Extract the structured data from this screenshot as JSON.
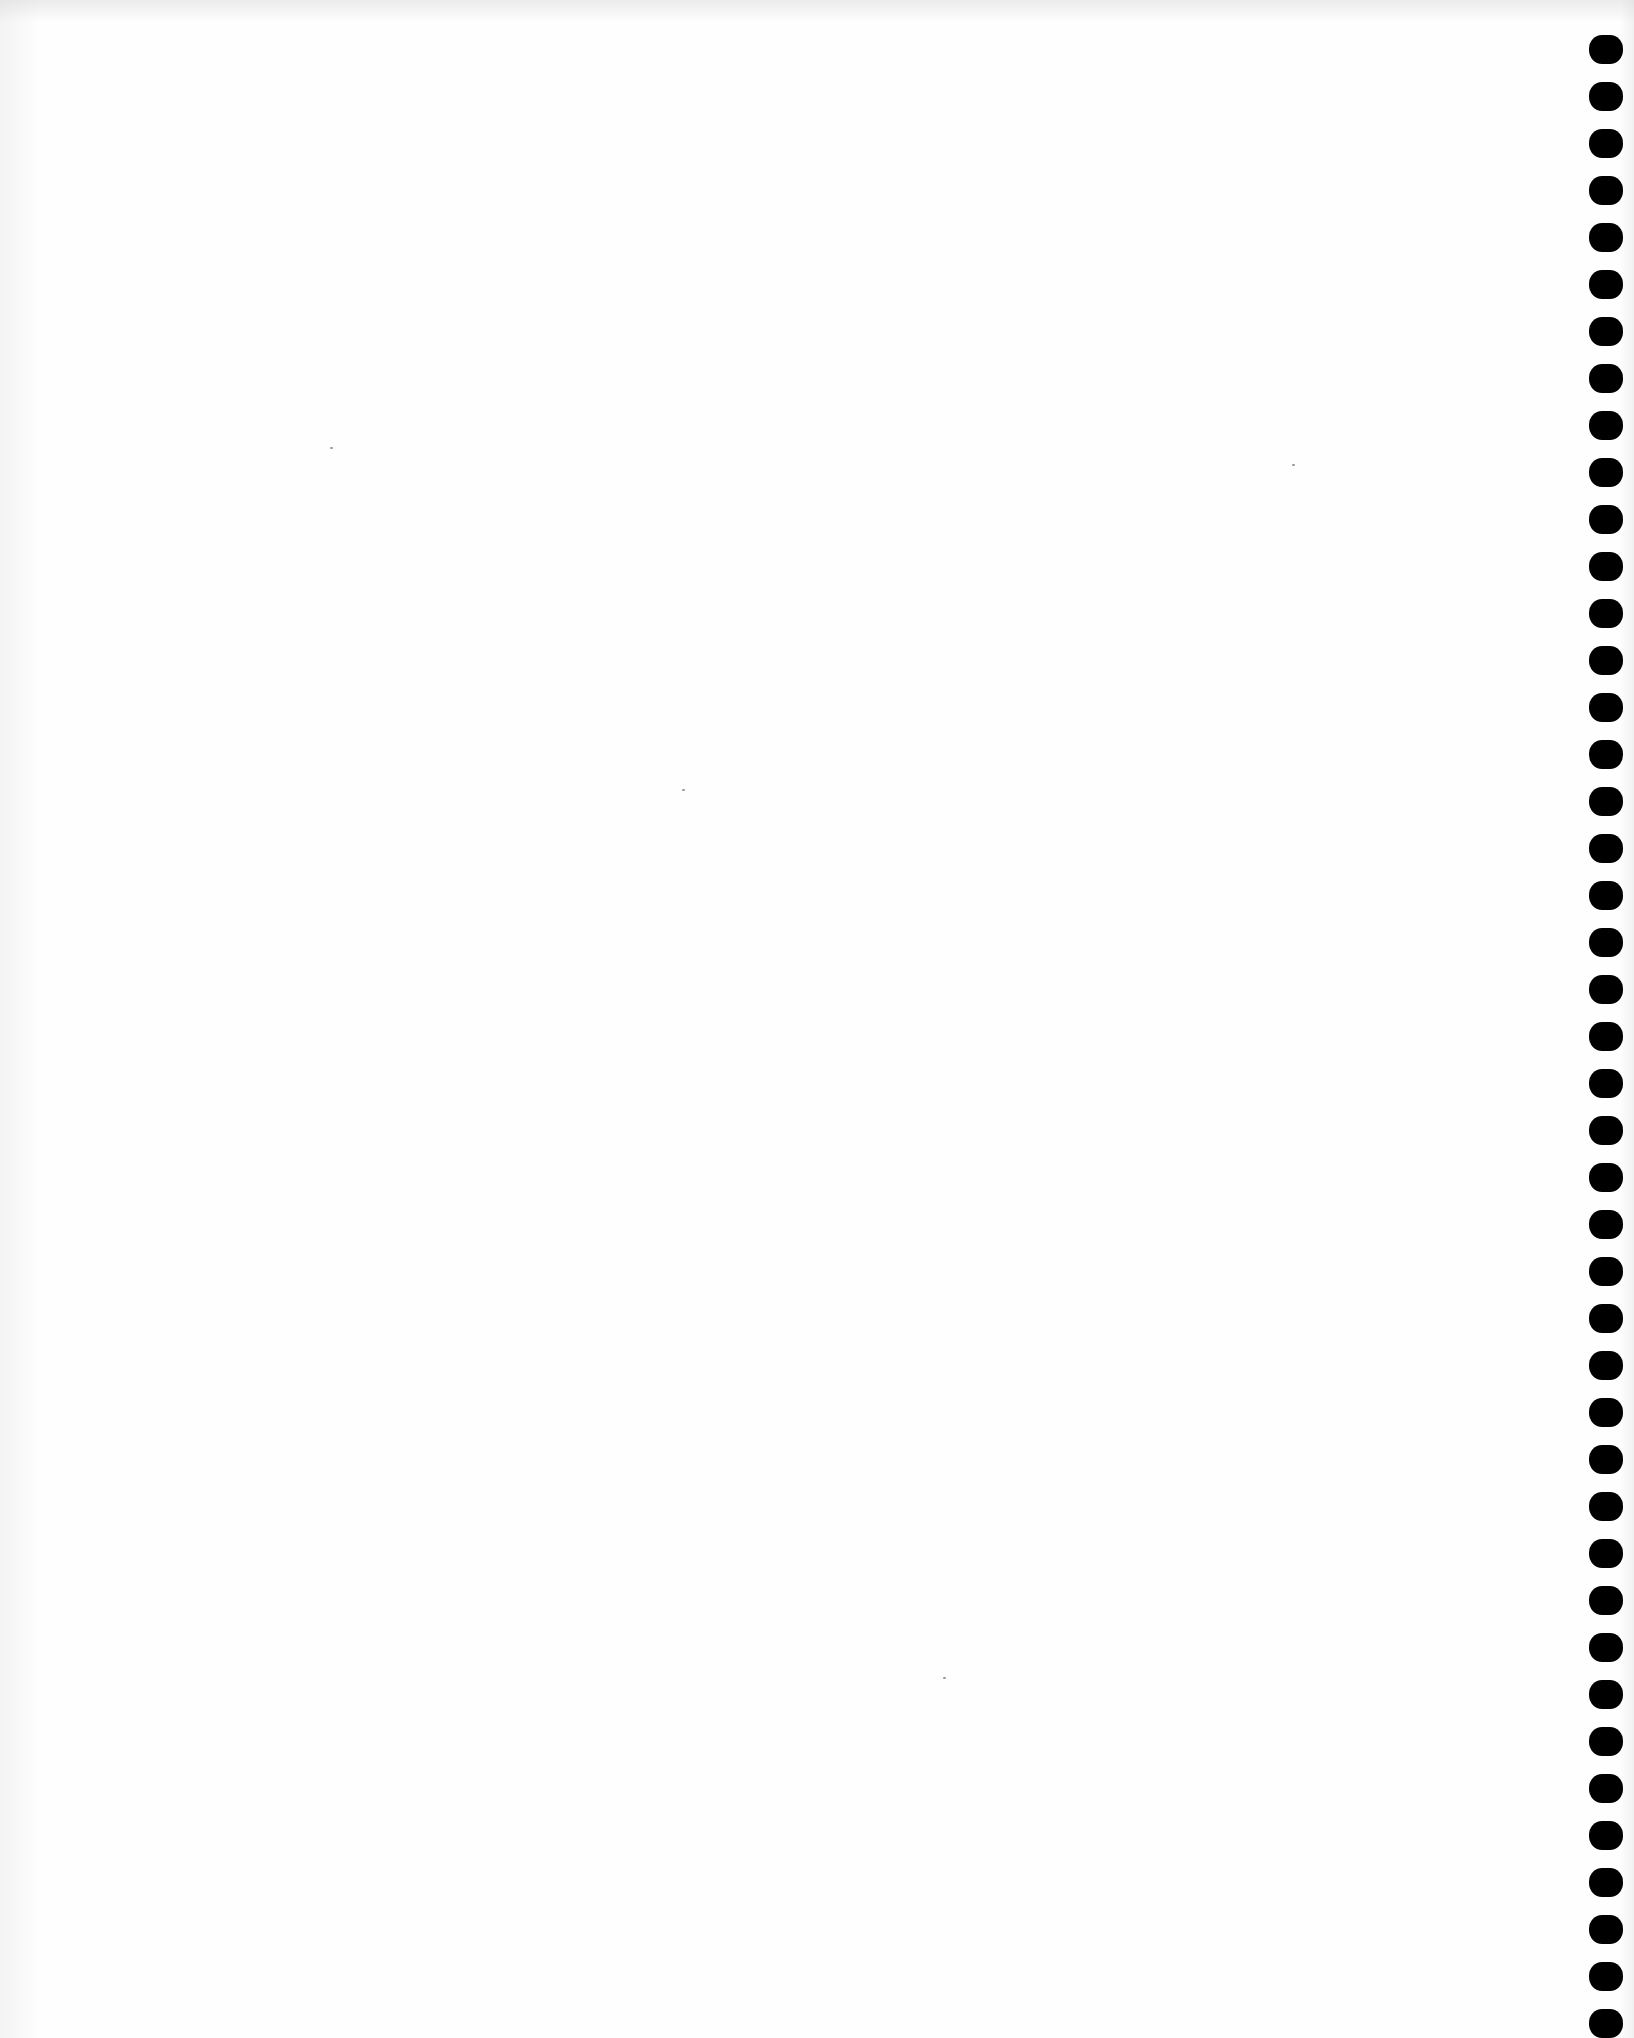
{
  "document": {
    "type": "blank scanned page",
    "background_color": "#fefefe",
    "text_content": ""
  },
  "punch_holes": {
    "side": "right",
    "count": 43,
    "color": "#000000",
    "left_px": 1589,
    "first_top_px": 35,
    "pitch_px": 47,
    "width_px": 34,
    "height_px": 29
  },
  "specks": [
    {
      "x": 682,
      "y": 789
    },
    {
      "x": 1292,
      "y": 464
    },
    {
      "x": 943,
      "y": 1677
    },
    {
      "x": 330,
      "y": 447
    }
  ]
}
